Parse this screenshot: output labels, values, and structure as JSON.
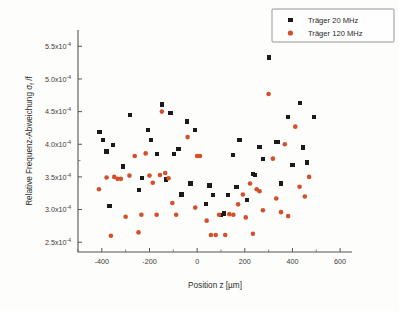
{
  "figure": {
    "background_color": "#fdfdfb",
    "axis_color": "#555555",
    "plot_area": {
      "left": 78,
      "right": 352,
      "top": 30,
      "bottom": 252
    }
  },
  "chart_data": {
    "type": "scatter",
    "title": "",
    "xlabel": "Position z [µm]",
    "ylabel": "Relative Frequenz-Abweichung σf /f",
    "xlim": [
      -500,
      650
    ],
    "ylim": [
      0.000235,
      0.000575
    ],
    "grid": false,
    "legend_position": "top-right",
    "xticks": [
      -400,
      -200,
      0,
      200,
      400,
      600
    ],
    "xticklabels": [
      "-400",
      "-200",
      "0",
      "200",
      "400",
      "600"
    ],
    "yticks": [
      0.00025,
      0.0003,
      0.00035,
      0.0004,
      0.00045,
      0.0005,
      0.00055
    ],
    "yticklabels": [
      "2.5x10",
      "3.0x10",
      "3.5x10",
      "4.0x10",
      "4.5x10",
      "5.0x10",
      "5.5x10"
    ],
    "y_exponent": "-4",
    "series": [
      {
        "name": "Träger 20 MHz",
        "marker": "square",
        "color": "#1a1a1a",
        "points": [
          [
            -410,
            0.000419
          ],
          [
            -395,
            0.000406
          ],
          [
            -380,
            0.000389
          ],
          [
            -368,
            0.000306
          ],
          [
            -352,
            0.000399
          ],
          [
            -312,
            0.000366
          ],
          [
            -283,
            0.000445
          ],
          [
            -244,
            0.00033
          ],
          [
            -232,
            0.000348
          ],
          [
            -205,
            0.000422
          ],
          [
            -193,
            0.000406
          ],
          [
            -168,
            0.000385
          ],
          [
            -148,
            0.000461
          ],
          [
            -130,
            0.000346
          ],
          [
            -112,
            0.000448
          ],
          [
            -96,
            0.000385
          ],
          [
            -78,
            0.000393
          ],
          [
            -66,
            0.000323
          ],
          [
            -42,
            0.000435
          ],
          [
            -28,
            0.00034
          ],
          [
            -10,
            0.000422
          ],
          [
            38,
            0.000309
          ],
          [
            52,
            0.000337
          ],
          [
            68,
            0.000322
          ],
          [
            100,
            0.000292
          ],
          [
            112,
            0.000294
          ],
          [
            128,
            0.000322
          ],
          [
            152,
            0.000383
          ],
          [
            165,
            0.000335
          ],
          [
            178,
            0.000406
          ],
          [
            208,
            0.000315
          ],
          [
            234,
            0.000355
          ],
          [
            244,
            0.000353
          ],
          [
            262,
            0.000396
          ],
          [
            276,
            0.000377
          ],
          [
            300,
            0.000533
          ],
          [
            330,
            0.000404
          ],
          [
            340,
            0.000404
          ],
          [
            352,
            0.00034
          ],
          [
            382,
            0.000442
          ],
          [
            400,
            0.000368
          ],
          [
            432,
            0.000463
          ],
          [
            444,
            0.000395
          ],
          [
            462,
            0.000372
          ],
          [
            492,
            0.000442
          ]
        ]
      },
      {
        "name": "Träger 120 MHz",
        "marker": "circle",
        "color": "#d2502a",
        "points": [
          [
            -412,
            0.000331
          ],
          [
            -380,
            0.000349
          ],
          [
            -362,
            0.00026
          ],
          [
            -348,
            0.00035
          ],
          [
            -334,
            0.000347
          ],
          [
            -320,
            0.000347
          ],
          [
            -300,
            0.000289
          ],
          [
            -284,
            0.000352
          ],
          [
            -262,
            0.000382
          ],
          [
            -246,
            0.000265
          ],
          [
            -234,
            0.000292
          ],
          [
            -216,
            0.000386
          ],
          [
            -200,
            0.000352
          ],
          [
            -186,
            0.000341
          ],
          [
            -170,
            0.000292
          ],
          [
            -156,
            0.000353
          ],
          [
            -148,
            0.00045
          ],
          [
            -134,
            0.000356
          ],
          [
            -120,
            0.000348
          ],
          [
            -104,
            0.00031
          ],
          [
            -88,
            0.000292
          ],
          [
            -40,
            0.000411
          ],
          [
            -8,
            0.000303
          ],
          [
            0,
            0.000382
          ],
          [
            12,
            0.000382
          ],
          [
            40,
            0.000283
          ],
          [
            58,
            0.000261
          ],
          [
            78,
            0.000261
          ],
          [
            92,
            0.000292
          ],
          [
            118,
            0.000261
          ],
          [
            135,
            0.000293
          ],
          [
            152,
            0.000292
          ],
          [
            172,
            0.000308
          ],
          [
            192,
            0.000323
          ],
          [
            204,
            0.000288
          ],
          [
            222,
            0.00034
          ],
          [
            234,
            0.000263
          ],
          [
            250,
            0.000331
          ],
          [
            262,
            0.000328
          ],
          [
            276,
            0.000299
          ],
          [
            300,
            0.000477
          ],
          [
            318,
            0.000378
          ],
          [
            332,
            0.000317
          ],
          [
            352,
            0.000296
          ],
          [
            368,
            0.0004
          ],
          [
            382,
            0.00029
          ],
          [
            412,
            0.000427
          ],
          [
            430,
            0.000335
          ],
          [
            452,
            0.00032
          ],
          [
            470,
            0.00035
          ]
        ]
      }
    ]
  },
  "legend": {
    "entries": [
      {
        "label": "Träger 20 MHz",
        "color": "#1a1a1a",
        "marker": "square"
      },
      {
        "label": "Träger 120 MHz",
        "color": "#d2502a",
        "marker": "circle"
      }
    ]
  }
}
